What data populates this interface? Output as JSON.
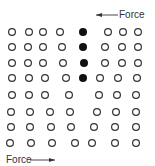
{
  "diagram": {
    "colors": {
      "stroke": "#333333",
      "filled": "#111111",
      "background": "#ffffff"
    },
    "atom_radius": 4,
    "force_top": {
      "label": "Force",
      "direction": "left",
      "arrow": {
        "x1": 118,
        "x2": 96,
        "y": 15
      }
    },
    "force_bottom": {
      "label": "Force",
      "direction": "right",
      "arrow": {
        "x1": 30,
        "x2": 55,
        "y": 160
      }
    },
    "rows": [
      {
        "y": 32,
        "open": [
          12,
          29,
          43,
          60,
          108,
          123,
          138
        ],
        "filled": [
          83
        ]
      },
      {
        "y": 47,
        "open": [
          12,
          28,
          43,
          62,
          105,
          122,
          138
        ],
        "filled": [
          83
        ]
      },
      {
        "y": 63,
        "open": [
          12,
          28,
          43,
          63,
          105,
          122,
          138
        ],
        "filled": [
          84
        ]
      },
      {
        "y": 78,
        "open": [
          12,
          29,
          45,
          66,
          100,
          118,
          137
        ],
        "filled": [
          83
        ]
      },
      {
        "y": 95,
        "open": [
          12,
          29,
          45,
          69,
          99,
          117,
          136
        ],
        "filled": []
      },
      {
        "y": 112,
        "open": [
          11,
          30,
          50,
          70,
          97,
          116,
          136
        ],
        "filled": []
      },
      {
        "y": 127,
        "open": [
          11,
          30,
          51,
          71,
          94,
          115,
          136
        ],
        "filled": []
      },
      {
        "y": 143,
        "open": [
          10,
          31,
          52,
          75,
          92,
          115,
          136
        ],
        "filled": []
      }
    ]
  }
}
